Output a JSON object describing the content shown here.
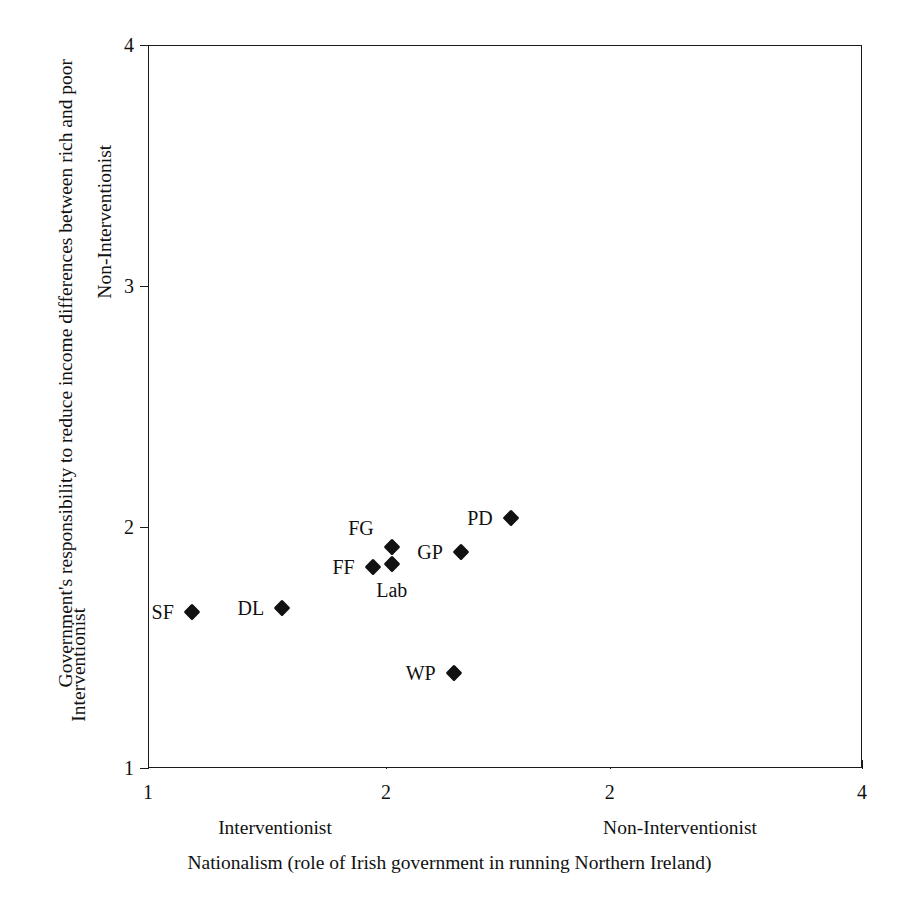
{
  "chart_data": {
    "type": "scatter",
    "title": "",
    "xlabel": "Nationalism (role of Irish government in running Northern Ireland)",
    "ylabel": "Government's responsibility to reduce income differences between rich and poor",
    "xlim": [
      1,
      4
    ],
    "ylim": [
      1,
      4
    ],
    "grid": false,
    "legend": "none",
    "x_tick_labels": [
      "1",
      "2",
      "2",
      "4"
    ],
    "x_tick_values": [
      1,
      2,
      2.94,
      4
    ],
    "y_tick_labels": [
      "1",
      "2",
      "3",
      "4"
    ],
    "y_tick_values": [
      1,
      2,
      3,
      4
    ],
    "x_axis_low_anchor": "Interventionist",
    "x_axis_high_anchor": "Non-Interventionist",
    "y_axis_low_anchor": "Interventionist",
    "y_axis_high_anchor": "Non-Interventionist",
    "points": [
      {
        "label": "SF",
        "x": 1.18,
        "y": 1.65,
        "label_pos": "left"
      },
      {
        "label": "DL",
        "x": 1.56,
        "y": 1.67,
        "label_pos": "left"
      },
      {
        "label": "FF",
        "x": 1.94,
        "y": 1.84,
        "label_pos": "left"
      },
      {
        "label": "FG",
        "x": 2.02,
        "y": 1.92,
        "label_pos": "above-left"
      },
      {
        "label": "Lab",
        "x": 2.02,
        "y": 1.85,
        "label_pos": "below"
      },
      {
        "label": "GP",
        "x": 2.31,
        "y": 1.9,
        "label_pos": "left"
      },
      {
        "label": "PD",
        "x": 2.52,
        "y": 2.04,
        "label_pos": "left"
      },
      {
        "label": "WP",
        "x": 2.28,
        "y": 1.4,
        "label_pos": "left"
      }
    ],
    "marker_color": "#111111",
    "marker_shape": "diamond",
    "axis_color": "#1a1a1a",
    "background_color": "#ffffff"
  }
}
